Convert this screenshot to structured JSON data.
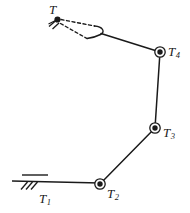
{
  "figure": {
    "kind": "kinematic-chain-diagram",
    "background_color": "#ffffff",
    "stroke_color": "#1a1a1a"
  },
  "labels": {
    "tool": {
      "base": "T",
      "sub": ""
    },
    "joint1": {
      "base": "T",
      "sub": "1"
    },
    "joint2": {
      "base": "T",
      "sub": "2"
    },
    "joint3": {
      "base": "T",
      "sub": "3"
    },
    "joint4": {
      "base": "T",
      "sub": "4"
    }
  },
  "geometry": {
    "ground": {
      "upper_line": {
        "x1": 22,
        "y1": 175,
        "x2": 48,
        "y2": 175
      },
      "main_line": {
        "x1": 12,
        "y1": 181,
        "x2": 100,
        "y2": 183
      },
      "hatch_marks": [
        {
          "x1": 21,
          "y1": 189,
          "x2": 27,
          "y2": 182
        },
        {
          "x1": 26,
          "y1": 189,
          "x2": 32,
          "y2": 182
        },
        {
          "x1": 31,
          "y1": 189,
          "x2": 37,
          "y2": 182
        }
      ]
    },
    "joints": [
      {
        "name": "joint2",
        "cx": 100,
        "cy": 184,
        "r_outer": 5.2,
        "r_dot": 2.6
      },
      {
        "name": "joint3",
        "cx": 155,
        "cy": 128,
        "r_outer": 5.2,
        "r_dot": 2.6
      },
      {
        "name": "joint4",
        "cx": 160,
        "cy": 52,
        "r_outer": 5.2,
        "r_dot": 2.6
      },
      {
        "name": "tool",
        "cx": 57,
        "cy": 20,
        "r_outer": 0,
        "r_dot": 3.0
      }
    ],
    "links": [
      {
        "name": "link-base-to-joint2",
        "x1": 12,
        "y1": 181,
        "x2": 100,
        "y2": 183
      },
      {
        "name": "link-joint2-to-joint3",
        "x1": 100,
        "y1": 184,
        "x2": 155,
        "y2": 128
      },
      {
        "name": "link-joint3-to-joint4",
        "x1": 155,
        "y1": 128,
        "x2": 160,
        "y2": 52
      },
      {
        "name": "link-joint4-to-gripper",
        "x1": 160,
        "y1": 52,
        "x2": 101,
        "y2": 33
      }
    ],
    "gripper": {
      "hook_path": "M 93 25 C 103 25 106 31 101 34 C 97 37 91 38 86 39",
      "jaw_upper": {
        "x1": 60,
        "y1": 19,
        "x2": 95,
        "y2": 26
      },
      "jaw_lower": {
        "x1": 60,
        "y1": 23,
        "x2": 87,
        "y2": 39
      },
      "dash_pattern": "3,2.6"
    },
    "tool_marks": [
      {
        "x1": 50,
        "y1": 27,
        "x2": 56,
        "y2": 21
      },
      {
        "x1": 53,
        "y1": 29,
        "x2": 59,
        "y2": 23
      },
      {
        "x1": 49,
        "y1": 24,
        "x2": 57,
        "y2": 20
      }
    ]
  }
}
